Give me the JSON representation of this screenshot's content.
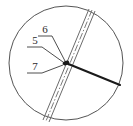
{
  "figure": {
    "background_color": "#ffffff",
    "outline_color": "#555555",
    "band_color": "#6b6b6b",
    "centerline_color": "#7a7a7a",
    "radial_color": "#1a1a1a",
    "node_color": "#1a1a1a",
    "leader_color": "#3a3a3a",
    "label_color": "#2b2b2b"
  },
  "circle": {
    "name": "outer-circle",
    "cx": 66,
    "cy": 63,
    "r": 57,
    "stroke_width": 1
  },
  "node": {
    "name": "center-node",
    "cx": 66,
    "cy": 63,
    "rx": 3.4,
    "ry": 2.2,
    "rotation": -18
  },
  "band": {
    "name": "parallel-band",
    "description": "Three parallel lines crossing the circle from upper-right to lower-left with a dash-dot centerline",
    "edge_a": {
      "x1": 89,
      "y1": 9,
      "x2": 43,
      "y2": 120
    },
    "edge_b": {
      "x1": 95,
      "y1": 11,
      "x2": 49,
      "y2": 122
    },
    "centerline": {
      "x1": 92,
      "y1": 10,
      "x2": 46,
      "y2": 121
    },
    "stroke_width": 1,
    "dash_pattern": "7 2 1.5 2"
  },
  "radial_line": {
    "name": "radial-line",
    "x1": 66,
    "y1": 63,
    "x2": 120,
    "y2": 85,
    "stroke_width": 2
  },
  "labels": [
    {
      "id": "label-6",
      "text": "6",
      "x": 45,
      "y": 33,
      "underline": {
        "x1": 38,
        "y1": 36,
        "x2": 52,
        "y2": 36
      },
      "leader": {
        "x1": 52,
        "y1": 36,
        "x2": 65,
        "y2": 61
      }
    },
    {
      "id": "label-5",
      "text": "5",
      "x": 35,
      "y": 44,
      "underline": {
        "x1": 27,
        "y1": 47,
        "x2": 42,
        "y2": 47
      },
      "leader": {
        "x1": 42,
        "y1": 47,
        "x2": 63,
        "y2": 62
      }
    },
    {
      "id": "label-7",
      "text": "7",
      "x": 35,
      "y": 70,
      "underline": {
        "x1": 27,
        "y1": 73,
        "x2": 42,
        "y2": 73
      },
      "leader": {
        "x1": 42,
        "y1": 73,
        "x2": 63,
        "y2": 65
      }
    }
  ]
}
